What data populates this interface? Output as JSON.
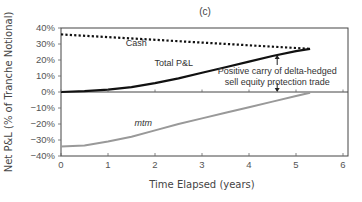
{
  "chart_data": {
    "type": "line",
    "title": "(c)",
    "xlabel": "Time Elapsed (years)",
    "ylabel": "Net P&L (% of Tranche Notional)",
    "xlim": [
      0,
      6
    ],
    "ylim": [
      -40,
      40
    ],
    "x_ticks": [
      0,
      1,
      2,
      3,
      4,
      5,
      6
    ],
    "x_tick_labels": [
      "0",
      "1",
      "2",
      "3",
      "4",
      "5",
      "6"
    ],
    "y_ticks": [
      40,
      30,
      20,
      10,
      0,
      -10,
      -20,
      -30,
      -40
    ],
    "y_tick_labels": [
      "40%",
      "30%",
      "20%",
      "10%",
      "0%",
      "−10%",
      "−20%",
      "−30%",
      "−40%"
    ],
    "grid": false,
    "legend": "inline labels",
    "series": [
      {
        "name": "Cash",
        "style": "dotted",
        "color": "#111111",
        "x": [
          0,
          1,
          2,
          3,
          4,
          5,
          5.3
        ],
        "values": [
          36,
          34.3,
          32.6,
          30.9,
          29.2,
          27.5,
          27
        ]
      },
      {
        "name": "Total P&L",
        "style": "solid",
        "color": "#111111",
        "x": [
          0,
          0.5,
          1,
          1.5,
          2,
          2.5,
          3,
          3.5,
          4,
          4.5,
          5,
          5.3
        ],
        "values": [
          0,
          0.5,
          1.5,
          3,
          5.5,
          8.5,
          12,
          15.5,
          19,
          22.5,
          25.5,
          27
        ]
      },
      {
        "name": "mtm",
        "style": "solid",
        "color": "#999999",
        "x": [
          0,
          0.5,
          1,
          1.5,
          2,
          2.5,
          3,
          3.5,
          4,
          4.5,
          5,
          5.3
        ],
        "values": [
          -34,
          -33.5,
          -31,
          -28,
          -24,
          -20,
          -16.5,
          -13,
          -9.5,
          -6,
          -2.5,
          -0.5
        ]
      }
    ],
    "annotations": [
      {
        "text_lines": [
          "Positive carry of delta-hedged",
          "sell equity protection trade"
        ],
        "x": 4.6,
        "arrow_up_to": 25,
        "arrow_down_to": 0
      }
    ],
    "series_labels": [
      {
        "text": "Cash",
        "x": 1.6,
        "y": 29
      },
      {
        "text": "Total P&L",
        "x": 2.4,
        "y": 16.5
      },
      {
        "text": "mtm",
        "x": 1.75,
        "y": -21.5,
        "italic": true
      }
    ]
  }
}
